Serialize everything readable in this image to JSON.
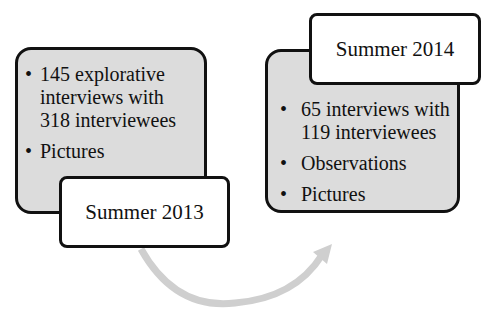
{
  "diagram": {
    "type": "timeline-process",
    "stages": [
      {
        "label": "Summer 2013",
        "items": [
          "145 explorative interviews with 318 interviewees",
          "Pictures"
        ]
      },
      {
        "label": "Summer 2014",
        "items": [
          "65 interviews with 119 interviewees",
          "Observations",
          "Pictures"
        ]
      }
    ],
    "connector": {
      "from": "Summer 2013",
      "to": "Summer 2014",
      "style": "curved-arrow"
    },
    "bullet_char": "•",
    "colors": {
      "panel_fill": "#dcdcdc",
      "border": "#111111",
      "label_fill": "#ffffff",
      "arrow": "#cfcfcf"
    }
  }
}
